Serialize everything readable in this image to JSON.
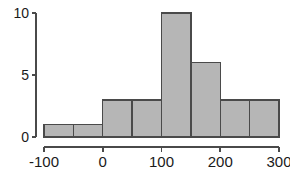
{
  "chart_data": {
    "type": "bar",
    "title": "",
    "subtitle": "",
    "xlabel": "",
    "ylabel": "",
    "categories": [
      "-100 to -50",
      "-50 to 0",
      "0 to 50",
      "50 to 100",
      "100 to 150",
      "150 to 200",
      "200 to 250",
      "250 to 300"
    ],
    "bin_edges": [
      -100,
      -50,
      0,
      50,
      100,
      150,
      200,
      250,
      300
    ],
    "bin_width": 50,
    "values": [
      1,
      1,
      3,
      3,
      10,
      6,
      3,
      3
    ],
    "xlim": [
      -100,
      300
    ],
    "ylim": [
      0,
      10
    ],
    "x_ticks": [
      -100,
      0,
      100,
      200,
      300
    ],
    "x_tick_labels": [
      "-100",
      "0",
      "100",
      "200",
      "300"
    ],
    "y_ticks": [
      0,
      5,
      10
    ],
    "y_tick_labels": [
      "0",
      "5",
      "10"
    ],
    "grid": false,
    "legend": null,
    "annotations": [],
    "style": {
      "bar_fill": "#b6b6b6",
      "bar_stroke": "#4a4a4a",
      "axis_color": "#4a4a4a",
      "text_color": "#1a1a1a",
      "background": "#ffffff"
    }
  }
}
